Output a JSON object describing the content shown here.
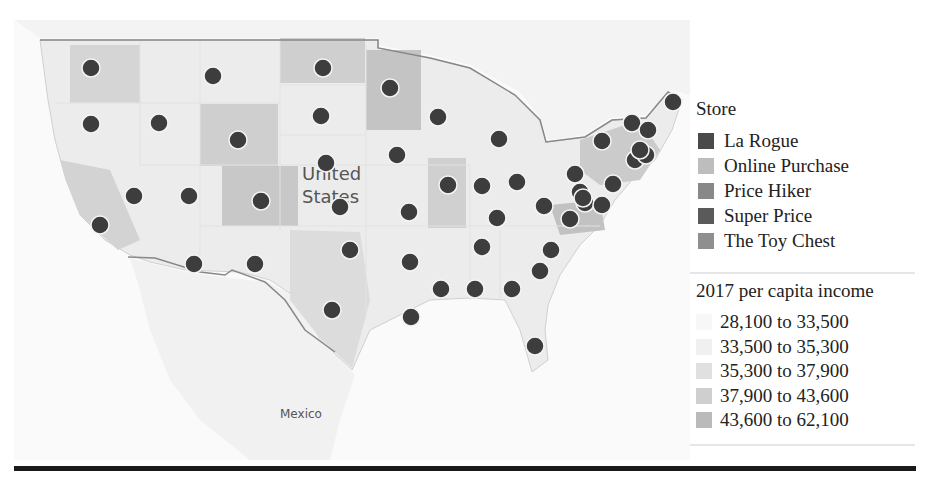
{
  "chart_data": {
    "type": "map",
    "title": "",
    "region": "United States",
    "labels": [
      "United States",
      "Mexico"
    ],
    "legend_position": "right",
    "store_legend": {
      "title": "Store",
      "entries": [
        {
          "label": "La Rogue",
          "color": "#4a4a4a"
        },
        {
          "label": "Online Purchase",
          "color": "#bdbdbd"
        },
        {
          "label": "Price Hiker",
          "color": "#888888"
        },
        {
          "label": "Super Price",
          "color": "#5a5a5a"
        },
        {
          "label": "The Toy Chest",
          "color": "#8f8f8f"
        }
      ]
    },
    "income_legend": {
      "title": "2017 per capita income",
      "entries": [
        {
          "label": "28,100 to 33,500",
          "color": "#f7f7f7"
        },
        {
          "label": "33,500 to 35,300",
          "color": "#f0f0f0"
        },
        {
          "label": "35,300 to 37,900",
          "color": "#e0e0e0"
        },
        {
          "label": "37,900 to 43,600",
          "color": "#cfcfcf"
        },
        {
          "label": "43,600 to 62,100",
          "color": "#bababa"
        }
      ]
    },
    "points_count": 50,
    "points_px": [
      [
        91,
        68
      ],
      [
        213,
        76
      ],
      [
        323,
        68
      ],
      [
        390,
        88
      ],
      [
        91,
        124
      ],
      [
        159,
        123
      ],
      [
        238,
        140
      ],
      [
        321,
        116
      ],
      [
        438,
        117
      ],
      [
        499,
        139
      ],
      [
        326,
        163
      ],
      [
        397,
        155
      ],
      [
        134,
        196
      ],
      [
        189,
        196
      ],
      [
        261,
        201
      ],
      [
        340,
        207
      ],
      [
        448,
        185
      ],
      [
        482,
        186
      ],
      [
        517,
        182
      ],
      [
        409,
        212
      ],
      [
        100,
        225
      ],
      [
        575,
        174
      ],
      [
        602,
        141
      ],
      [
        632,
        123
      ],
      [
        648,
        130
      ],
      [
        673,
        102
      ],
      [
        635,
        160
      ],
      [
        646,
        155
      ],
      [
        580,
        192
      ],
      [
        585,
        203
      ],
      [
        613,
        184
      ],
      [
        602,
        205
      ],
      [
        544,
        206
      ],
      [
        497,
        218
      ],
      [
        570,
        219
      ],
      [
        350,
        250
      ],
      [
        410,
        262
      ],
      [
        482,
        247
      ],
      [
        551,
        250
      ],
      [
        194,
        264
      ],
      [
        255,
        264
      ],
      [
        540,
        271
      ],
      [
        332,
        310
      ],
      [
        441,
        289
      ],
      [
        475,
        289
      ],
      [
        512,
        289
      ],
      [
        411,
        317
      ],
      [
        535,
        346
      ],
      [
        640,
        150
      ],
      [
        583,
        198
      ]
    ]
  },
  "map": {
    "country_label_line1": "United",
    "country_label_line2": "States",
    "neighbor_label": "Mexico"
  },
  "legend": {
    "store_title": "Store",
    "stores": [
      "La Rogue",
      "Online Purchase",
      "Price Hiker",
      "Super Price",
      "The Toy Chest"
    ],
    "store_colors": [
      "#4a4a4a",
      "#bdbdbd",
      "#888888",
      "#5a5a5a",
      "#8f8f8f"
    ],
    "income_title": "2017 per capita income",
    "income_ranges": [
      "28,100 to 33,500",
      "33,500 to 35,300",
      "35,300 to 37,900",
      "37,900 to 43,600",
      "43,600 to 62,100"
    ],
    "income_colors": [
      "#f7f7f7",
      "#f0f0f0",
      "#e0e0e0",
      "#cfcfcf",
      "#bababa"
    ]
  }
}
